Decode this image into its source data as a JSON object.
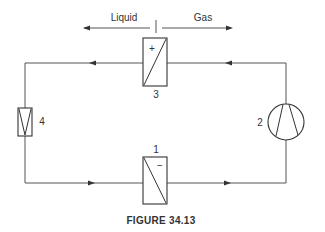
{
  "diagram": {
    "type": "refrigeration-cycle-schematic",
    "phase_labels": {
      "left": "Liquid",
      "right": "Gas"
    },
    "components": [
      {
        "id": "1",
        "label": "1",
        "role": "evaporator",
        "sign": "−"
      },
      {
        "id": "2",
        "label": "2",
        "role": "compressor"
      },
      {
        "id": "3",
        "label": "3",
        "role": "condenser",
        "sign": "+"
      },
      {
        "id": "4",
        "label": "4",
        "role": "expansion-valve"
      }
    ],
    "flow_direction": "clockwise-from-compressor: 2 -> 3 -> 4 -> 1 -> 2",
    "caption": "FIGURE 34.13"
  }
}
